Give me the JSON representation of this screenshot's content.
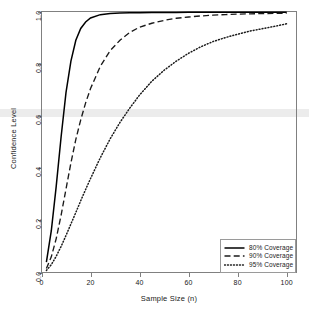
{
  "chart_data": {
    "type": "line",
    "title": "",
    "xlabel": "Sample Size (n)",
    "ylabel": "Confidence Level",
    "xlim": [
      0,
      104
    ],
    "ylim": [
      0.0,
      1.0
    ],
    "xticks": [
      "0",
      "20",
      "40",
      "60",
      "80",
      "100"
    ],
    "xtick_values": [
      0,
      20,
      40,
      60,
      80,
      100
    ],
    "yticks": [
      "0.0",
      "0.2",
      "0.4",
      "0.6",
      "0.8",
      "1.0"
    ],
    "ytick_values": [
      0.0,
      0.2,
      0.4,
      0.6,
      0.8,
      1.0
    ],
    "grid": false,
    "legend_position": "bottom-right",
    "annotations": [
      {
        "name": "reference-band",
        "type": "hband",
        "y": 0.61,
        "half_height": 0.016,
        "color": "#ececec",
        "label": ""
      }
    ],
    "x": [
      2,
      4,
      6,
      8,
      10,
      12,
      14,
      16,
      18,
      20,
      24,
      28,
      32,
      36,
      40,
      45,
      50,
      55,
      60,
      65,
      70,
      75,
      80,
      85,
      90,
      95,
      100
    ],
    "series": [
      {
        "name": "80% Coverage",
        "style": "solid",
        "color": "#000000",
        "values": [
          0.04,
          0.16,
          0.33,
          0.52,
          0.69,
          0.81,
          0.89,
          0.935,
          0.96,
          0.975,
          0.988,
          0.992,
          0.994,
          0.995,
          0.9955,
          0.996,
          0.9962,
          0.9965,
          0.9967,
          0.9968,
          0.997,
          0.997,
          0.9972,
          0.9973,
          0.9974,
          0.9975,
          0.9975
        ]
      },
      {
        "name": "90% Coverage",
        "style": "dashed",
        "color": "#1a1a1a",
        "values": [
          0.015,
          0.06,
          0.13,
          0.22,
          0.32,
          0.42,
          0.51,
          0.585,
          0.65,
          0.705,
          0.79,
          0.85,
          0.89,
          0.92,
          0.94,
          0.955,
          0.966,
          0.974,
          0.979,
          0.983,
          0.986,
          0.988,
          0.99,
          0.991,
          0.992,
          0.993,
          0.9935
        ]
      },
      {
        "name": "95% Coverage",
        "style": "dotted",
        "color": "#1a1a1a",
        "values": [
          0.008,
          0.03,
          0.062,
          0.1,
          0.142,
          0.186,
          0.23,
          0.275,
          0.318,
          0.36,
          0.44,
          0.512,
          0.575,
          0.63,
          0.68,
          0.733,
          0.775,
          0.81,
          0.84,
          0.865,
          0.885,
          0.9,
          0.913,
          0.925,
          0.934,
          0.943,
          0.953
        ]
      }
    ]
  },
  "legend": {
    "items": [
      {
        "label": "80% Coverage",
        "style": "solid"
      },
      {
        "label": "90% Coverage",
        "style": "dashed"
      },
      {
        "label": "95% Coverage",
        "style": "dotted"
      }
    ]
  }
}
